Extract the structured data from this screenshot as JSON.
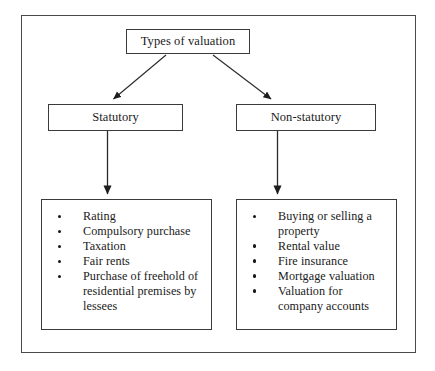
{
  "diagram": {
    "root": {
      "label": "Types of valuation"
    },
    "branches": [
      {
        "name": "statutory",
        "label": "Statutory",
        "items": [
          "Rating",
          "Compulsory purchase",
          "Taxation",
          "Fair rents",
          "Purchase of freehold  of residential premises by lessees"
        ]
      },
      {
        "name": "non-statutory",
        "label": "Non-statutory",
        "items": [
          "Buying or selling a property",
          "Rental value",
          "Fire insurance",
          "Mortgage valuation",
          "Valuation for company accounts"
        ]
      }
    ],
    "colors": {
      "border": "#3a3a3a",
      "frame": "#4a4a4a",
      "text": "#1a1a1a",
      "background": "#ffffff",
      "connector": "#2b2b2b"
    }
  }
}
